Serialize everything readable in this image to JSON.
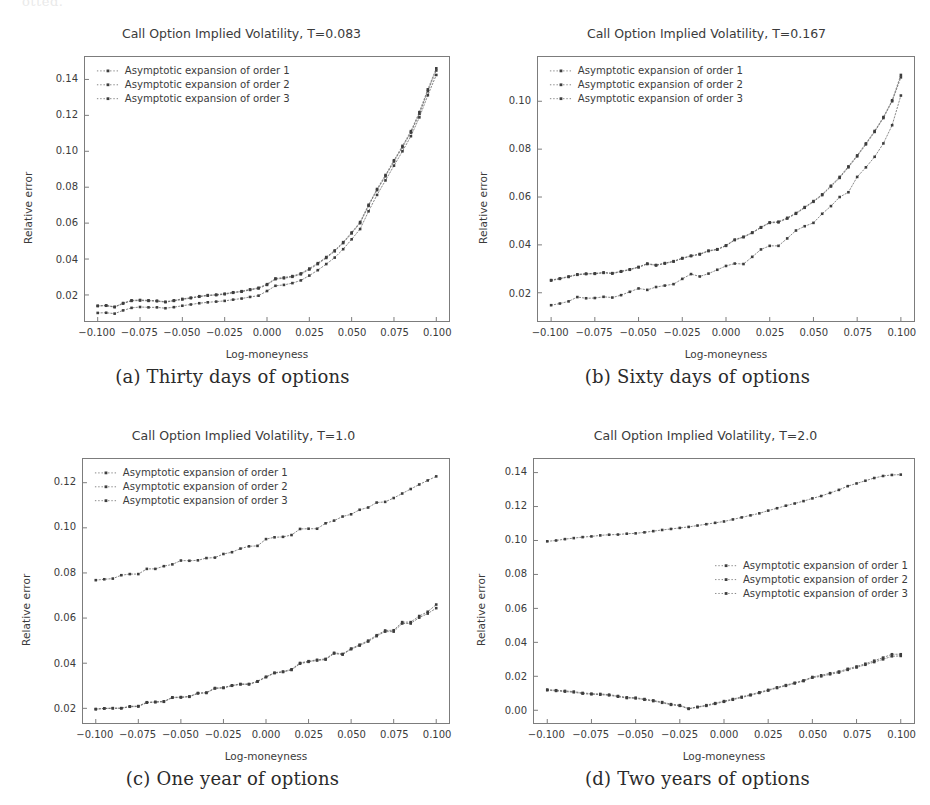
{
  "page": {
    "scan_remnant": "otted.",
    "background": "#ffffff",
    "ink_color": "#3b3b3b",
    "series_color": "#555555"
  },
  "legend_labels": [
    "Asymptotic expansion of order 1",
    "Asymptotic expansion of order 2",
    "Asymptotic expansion of order 3"
  ],
  "panels": [
    {
      "key": "a",
      "caption": "(a) Thirty days of options",
      "legend_position": "upper left"
    },
    {
      "key": "b",
      "caption": "(b) Sixty days of options",
      "legend_position": "upper left"
    },
    {
      "key": "c",
      "caption": "(c) One year of options",
      "legend_position": "upper left"
    },
    {
      "key": "d",
      "caption": "(d) Two years of options",
      "legend_position": "center right"
    }
  ],
  "chart_data": [
    {
      "id": "panel-a",
      "type": "line",
      "title": "Call Option Implied Volatility, T=0.083",
      "xlabel": "Log-moneyness",
      "ylabel": "Relative error",
      "xlim": [
        -0.1075,
        0.1075
      ],
      "ylim": [
        0.0055,
        0.1525
      ],
      "xticks": [
        -0.1,
        -0.075,
        -0.05,
        -0.025,
        0.0,
        0.025,
        0.05,
        0.075,
        0.1
      ],
      "xticklabels": [
        "−0.100",
        "−0.075",
        "−0.050",
        "−0.025",
        "0.000",
        "0.025",
        "0.050",
        "0.075",
        "0.100"
      ],
      "yticks": [
        0.02,
        0.04,
        0.06,
        0.08,
        0.1,
        0.12,
        0.14
      ],
      "yticklabels": [
        "0.02",
        "0.04",
        "0.06",
        "0.08",
        "0.10",
        "0.12",
        "0.14"
      ],
      "grid": false,
      "legend": [
        "Asymptotic expansion of order 1",
        "Asymptotic expansion of order 2",
        "Asymptotic expansion of order 3"
      ],
      "x": [
        -0.1,
        -0.095,
        -0.09,
        -0.085,
        -0.08,
        -0.075,
        -0.07,
        -0.065,
        -0.06,
        -0.055,
        -0.05,
        -0.045,
        -0.04,
        -0.035,
        -0.03,
        -0.025,
        -0.02,
        -0.015,
        -0.01,
        -0.005,
        0.0,
        0.005,
        0.01,
        0.015,
        0.02,
        0.025,
        0.03,
        0.035,
        0.04,
        0.045,
        0.05,
        0.055,
        0.06,
        0.065,
        0.07,
        0.075,
        0.08,
        0.085,
        0.09,
        0.095,
        0.1
      ],
      "series": [
        {
          "name": "Asymptotic expansion of order 1",
          "values": [
            0.01,
            0.0101,
            0.0096,
            0.0114,
            0.0128,
            0.0133,
            0.0131,
            0.0131,
            0.0126,
            0.0132,
            0.014,
            0.0147,
            0.0154,
            0.0159,
            0.0163,
            0.0167,
            0.0174,
            0.018,
            0.0189,
            0.0196,
            0.0222,
            0.0251,
            0.0256,
            0.0266,
            0.0281,
            0.0308,
            0.0338,
            0.0372,
            0.0408,
            0.0455,
            0.051,
            0.0567,
            0.0666,
            0.0757,
            0.0838,
            0.092,
            0.1,
            0.1084,
            0.1189,
            0.1312,
            0.1425
          ]
        },
        {
          "name": "Asymptotic expansion of order 2",
          "values": [
            0.0138,
            0.014,
            0.0132,
            0.0152,
            0.0167,
            0.0169,
            0.0167,
            0.0165,
            0.016,
            0.0167,
            0.0175,
            0.0182,
            0.019,
            0.0196,
            0.0199,
            0.0204,
            0.0212,
            0.0218,
            0.0228,
            0.0236,
            0.0256,
            0.0288,
            0.0293,
            0.0301,
            0.0315,
            0.0342,
            0.0372,
            0.0406,
            0.0443,
            0.0489,
            0.0543,
            0.06,
            0.0696,
            0.0784,
            0.0861,
            0.0943,
            0.1022,
            0.1104,
            0.1209,
            0.1335,
            0.145
          ]
        },
        {
          "name": "Asymptotic expansion of order 3",
          "values": [
            0.014,
            0.0142,
            0.0134,
            0.0155,
            0.017,
            0.0172,
            0.017,
            0.0168,
            0.0162,
            0.017,
            0.0178,
            0.0185,
            0.0193,
            0.0199,
            0.0202,
            0.0207,
            0.0215,
            0.0221,
            0.0231,
            0.024,
            0.026,
            0.0292,
            0.0297,
            0.0305,
            0.032,
            0.0347,
            0.0377,
            0.0411,
            0.0448,
            0.0494,
            0.0548,
            0.0606,
            0.0702,
            0.079,
            0.0868,
            0.095,
            0.103,
            0.1112,
            0.1218,
            0.1345,
            0.1462
          ]
        }
      ]
    },
    {
      "id": "panel-b",
      "type": "line",
      "title": "Call Option Implied Volatility, T=0.167",
      "xlabel": "Log-moneyness",
      "ylabel": "Relative error",
      "xlim": [
        -0.1075,
        0.1075
      ],
      "ylim": [
        0.0082,
        0.1185
      ],
      "xticks": [
        -0.1,
        -0.075,
        -0.05,
        -0.025,
        0.0,
        0.025,
        0.05,
        0.075,
        0.1
      ],
      "xticklabels": [
        "−0.100",
        "−0.075",
        "−0.050",
        "−0.025",
        "0.000",
        "0.025",
        "0.050",
        "0.075",
        "0.100"
      ],
      "yticks": [
        0.02,
        0.04,
        0.06,
        0.08,
        0.1
      ],
      "yticklabels": [
        "0.02",
        "0.04",
        "0.06",
        "0.08",
        "0.10"
      ],
      "grid": false,
      "legend": [
        "Asymptotic expansion of order 1",
        "Asymptotic expansion of order 2",
        "Asymptotic expansion of order 3"
      ],
      "x": [
        -0.1,
        -0.095,
        -0.09,
        -0.085,
        -0.08,
        -0.075,
        -0.07,
        -0.065,
        -0.06,
        -0.055,
        -0.05,
        -0.045,
        -0.04,
        -0.035,
        -0.03,
        -0.025,
        -0.02,
        -0.015,
        -0.01,
        -0.005,
        0.0,
        0.005,
        0.01,
        0.015,
        0.02,
        0.025,
        0.03,
        0.035,
        0.04,
        0.045,
        0.05,
        0.055,
        0.06,
        0.065,
        0.07,
        0.075,
        0.08,
        0.085,
        0.09,
        0.095,
        0.1
      ],
      "series": [
        {
          "name": "Asymptotic expansion of order 1",
          "values": [
            0.0148,
            0.0155,
            0.0164,
            0.0182,
            0.0177,
            0.0178,
            0.0183,
            0.018,
            0.019,
            0.0204,
            0.0218,
            0.0212,
            0.0224,
            0.023,
            0.0236,
            0.0258,
            0.0278,
            0.0268,
            0.028,
            0.0296,
            0.0312,
            0.0322,
            0.032,
            0.035,
            0.0381,
            0.0396,
            0.0396,
            0.0427,
            0.046,
            0.0478,
            0.0492,
            0.053,
            0.0562,
            0.06,
            0.062,
            0.0684,
            0.0724,
            0.0768,
            0.0824,
            0.09,
            0.1024
          ]
        },
        {
          "name": "Asymptotic expansion of order 2",
          "values": [
            0.0251,
            0.0258,
            0.0266,
            0.0275,
            0.0278,
            0.0279,
            0.0283,
            0.028,
            0.0288,
            0.0296,
            0.0306,
            0.032,
            0.0314,
            0.0322,
            0.033,
            0.0343,
            0.0353,
            0.036,
            0.0374,
            0.038,
            0.0396,
            0.042,
            0.0432,
            0.045,
            0.0472,
            0.0492,
            0.0494,
            0.051,
            0.053,
            0.0555,
            0.058,
            0.0608,
            0.0644,
            0.068,
            0.0724,
            0.077,
            0.082,
            0.0872,
            0.093,
            0.1,
            0.11
          ]
        },
        {
          "name": "Asymptotic expansion of order 3",
          "values": [
            0.0253,
            0.026,
            0.0268,
            0.0277,
            0.028,
            0.0281,
            0.0285,
            0.0282,
            0.029,
            0.0298,
            0.0308,
            0.0322,
            0.0316,
            0.0324,
            0.0332,
            0.0345,
            0.0355,
            0.0362,
            0.0376,
            0.0382,
            0.0398,
            0.0422,
            0.0434,
            0.0452,
            0.0474,
            0.0494,
            0.0497,
            0.0513,
            0.0533,
            0.0558,
            0.0583,
            0.0611,
            0.0647,
            0.0684,
            0.0728,
            0.0774,
            0.0824,
            0.0876,
            0.0934,
            0.1004,
            0.111
          ]
        }
      ]
    },
    {
      "id": "panel-c",
      "type": "line",
      "title": "Call Option Implied Volatility, T=1.0",
      "xlabel": "Log-moneyness",
      "ylabel": "Relative error",
      "xlim": [
        -0.1075,
        0.1075
      ],
      "ylim": [
        0.0135,
        0.1305
      ],
      "xticks": [
        -0.1,
        -0.075,
        -0.05,
        -0.025,
        0.0,
        0.025,
        0.05,
        0.075,
        0.1
      ],
      "xticklabels": [
        "−0.100",
        "−0.075",
        "−0.050",
        "−0.025",
        "0.000",
        "0.025",
        "0.050",
        "0.075",
        "0.100"
      ],
      "yticks": [
        0.02,
        0.04,
        0.06,
        0.08,
        0.1,
        0.12
      ],
      "yticklabels": [
        "0.02",
        "0.04",
        "0.06",
        "0.08",
        "0.10",
        "0.12"
      ],
      "grid": false,
      "legend": [
        "Asymptotic expansion of order 1",
        "Asymptotic expansion of order 2",
        "Asymptotic expansion of order 3"
      ],
      "x": [
        -0.1,
        -0.095,
        -0.09,
        -0.085,
        -0.08,
        -0.075,
        -0.07,
        -0.065,
        -0.06,
        -0.055,
        -0.05,
        -0.045,
        -0.04,
        -0.035,
        -0.03,
        -0.025,
        -0.02,
        -0.015,
        -0.01,
        -0.005,
        0.0,
        0.005,
        0.01,
        0.015,
        0.02,
        0.025,
        0.03,
        0.035,
        0.04,
        0.045,
        0.05,
        0.055,
        0.06,
        0.065,
        0.07,
        0.075,
        0.08,
        0.085,
        0.09,
        0.095,
        0.1
      ],
      "series": [
        {
          "name": "Asymptotic expansion of order 1",
          "values": [
            0.0196,
            0.0199,
            0.02,
            0.02,
            0.0207,
            0.0208,
            0.0225,
            0.0227,
            0.0229,
            0.0247,
            0.0248,
            0.0251,
            0.0266,
            0.0268,
            0.0288,
            0.029,
            0.03,
            0.0306,
            0.0306,
            0.0318,
            0.0338,
            0.0356,
            0.0361,
            0.037,
            0.0398,
            0.0406,
            0.0412,
            0.0416,
            0.0443,
            0.0438,
            0.0462,
            0.0478,
            0.0496,
            0.052,
            0.054,
            0.054,
            0.0576,
            0.0576,
            0.0602,
            0.062,
            0.0644
          ]
        },
        {
          "name": "Asymptotic expansion of order 2",
          "values": [
            0.0197,
            0.02,
            0.0201,
            0.0201,
            0.0209,
            0.021,
            0.0227,
            0.0229,
            0.0231,
            0.0249,
            0.025,
            0.0253,
            0.0268,
            0.027,
            0.029,
            0.0292,
            0.0302,
            0.0308,
            0.0308,
            0.032,
            0.034,
            0.0358,
            0.0363,
            0.0373,
            0.0401,
            0.0409,
            0.0415,
            0.0419,
            0.0446,
            0.0441,
            0.0465,
            0.0482,
            0.05,
            0.0524,
            0.0545,
            0.0546,
            0.0582,
            0.0582,
            0.0609,
            0.0628,
            0.066
          ]
        },
        {
          "name": "Asymptotic expansion of order 3",
          "values": [
            0.0768,
            0.0772,
            0.0775,
            0.079,
            0.0795,
            0.0795,
            0.0818,
            0.0818,
            0.083,
            0.0838,
            0.0855,
            0.0854,
            0.0856,
            0.0866,
            0.0868,
            0.0884,
            0.0892,
            0.0908,
            0.0918,
            0.092,
            0.095,
            0.0958,
            0.096,
            0.0968,
            0.0995,
            0.0996,
            0.0996,
            0.102,
            0.1032,
            0.105,
            0.106,
            0.108,
            0.109,
            0.1112,
            0.1115,
            0.1132,
            0.1152,
            0.1172,
            0.1192,
            0.121,
            0.1228
          ]
        }
      ]
    },
    {
      "id": "panel-d",
      "type": "line",
      "title": "Call Option Implied Volatility, T=2.0",
      "xlabel": "Log-moneyness",
      "ylabel": "Relative error",
      "xlim": [
        -0.1075,
        0.1075
      ],
      "ylim": [
        -0.0075,
        0.148
      ],
      "xticks": [
        -0.1,
        -0.075,
        -0.05,
        -0.025,
        0.0,
        0.025,
        0.05,
        0.075,
        0.1
      ],
      "xticklabels": [
        "−0.100",
        "−0.075",
        "−0.050",
        "−0.025",
        "0.000",
        "0.025",
        "0.050",
        "0.075",
        "0.100"
      ],
      "yticks": [
        0.0,
        0.02,
        0.04,
        0.06,
        0.08,
        0.1,
        0.12,
        0.14
      ],
      "yticklabels": [
        "0.00",
        "0.02",
        "0.04",
        "0.06",
        "0.08",
        "0.10",
        "0.12",
        "0.14"
      ],
      "grid": false,
      "legend": [
        "Asymptotic expansion of order 1",
        "Asymptotic expansion of order 2",
        "Asymptotic expansion of order 3"
      ],
      "x": [
        -0.1,
        -0.095,
        -0.09,
        -0.085,
        -0.08,
        -0.075,
        -0.07,
        -0.065,
        -0.06,
        -0.055,
        -0.05,
        -0.045,
        -0.04,
        -0.035,
        -0.03,
        -0.025,
        -0.02,
        -0.015,
        -0.01,
        -0.005,
        0.0,
        0.005,
        0.01,
        0.015,
        0.02,
        0.025,
        0.03,
        0.035,
        0.04,
        0.045,
        0.05,
        0.055,
        0.06,
        0.065,
        0.07,
        0.075,
        0.08,
        0.085,
        0.09,
        0.095,
        0.1
      ],
      "series": [
        {
          "name": "Asymptotic expansion of order 1",
          "values": [
            0.0118,
            0.0114,
            0.011,
            0.0106,
            0.0098,
            0.0094,
            0.0092,
            0.0088,
            0.008,
            0.0072,
            0.007,
            0.0062,
            0.0054,
            0.0044,
            0.0032,
            0.0026,
            0.0008,
            0.0018,
            0.0026,
            0.0038,
            0.005,
            0.0062,
            0.0075,
            0.0088,
            0.0102,
            0.0116,
            0.0131,
            0.0144,
            0.0158,
            0.0172,
            0.0192,
            0.02,
            0.0212,
            0.0222,
            0.0238,
            0.0252,
            0.0268,
            0.0284,
            0.03,
            0.0318,
            0.032
          ]
        },
        {
          "name": "Asymptotic expansion of order 2",
          "values": [
            0.0122,
            0.0118,
            0.0114,
            0.011,
            0.0102,
            0.0098,
            0.0096,
            0.0092,
            0.0084,
            0.0076,
            0.0074,
            0.0066,
            0.0058,
            0.0048,
            0.0036,
            0.003,
            0.001,
            0.002,
            0.003,
            0.0042,
            0.0054,
            0.0066,
            0.0079,
            0.0092,
            0.0106,
            0.012,
            0.0135,
            0.0148,
            0.0162,
            0.0176,
            0.0196,
            0.0206,
            0.0218,
            0.0228,
            0.0244,
            0.0258,
            0.0274,
            0.0292,
            0.031,
            0.033,
            0.033
          ]
        },
        {
          "name": "Asymptotic expansion of order 3",
          "values": [
            0.0995,
            0.1,
            0.1008,
            0.1014,
            0.102,
            0.1024,
            0.103,
            0.1034,
            0.1035,
            0.104,
            0.1042,
            0.1048,
            0.1055,
            0.1062,
            0.1068,
            0.1074,
            0.108,
            0.1088,
            0.1096,
            0.1104,
            0.1112,
            0.1124,
            0.1136,
            0.1148,
            0.116,
            0.1176,
            0.119,
            0.1205,
            0.1218,
            0.1232,
            0.1248,
            0.1262,
            0.128,
            0.1298,
            0.132,
            0.1336,
            0.1352,
            0.1368,
            0.138,
            0.1386,
            0.1388
          ]
        }
      ]
    }
  ]
}
